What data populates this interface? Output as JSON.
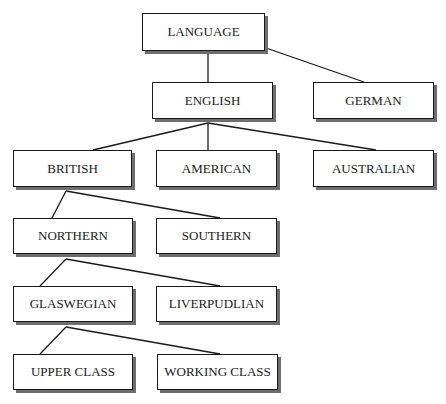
{
  "diagram": {
    "type": "tree",
    "title": "",
    "nodes": {
      "language": {
        "label": "LANGUAGE"
      },
      "english": {
        "label": "ENGLISH"
      },
      "german": {
        "label": "GERMAN"
      },
      "british": {
        "label": "BRITISH"
      },
      "american": {
        "label": "AMERICAN"
      },
      "australian": {
        "label": "AUSTRALIAN"
      },
      "northern": {
        "label": "NORTHERN"
      },
      "southern": {
        "label": "SOUTHERN"
      },
      "glaswegian": {
        "label": "GLASWEGIAN"
      },
      "liverpudlian": {
        "label": "LIVERPUDLIAN"
      },
      "upper_class": {
        "label": "UPPER CLASS"
      },
      "working_class": {
        "label": "WORKING CLASS"
      }
    },
    "edges": [
      [
        "LANGUAGE",
        "ENGLISH"
      ],
      [
        "LANGUAGE",
        "GERMAN"
      ],
      [
        "ENGLISH",
        "BRITISH"
      ],
      [
        "ENGLISH",
        "AMERICAN"
      ],
      [
        "ENGLISH",
        "AUSTRALIAN"
      ],
      [
        "BRITISH",
        "NORTHERN"
      ],
      [
        "BRITISH",
        "SOUTHERN"
      ],
      [
        "NORTHERN",
        "GLASWEGIAN"
      ],
      [
        "NORTHERN",
        "LIVERPUDLIAN"
      ],
      [
        "GLASWEGIAN",
        "UPPER CLASS"
      ],
      [
        "GLASWEGIAN",
        "WORKING CLASS"
      ]
    ]
  }
}
